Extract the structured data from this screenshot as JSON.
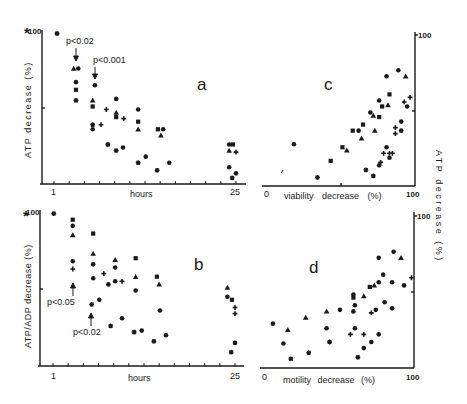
{
  "figure": {
    "asterisk_a": "*",
    "asterisk_b": "*",
    "colors": {
      "ink": "#1a1a1a",
      "background": "#ffffff"
    }
  },
  "chart_data": [
    {
      "id": "a",
      "type": "scatter",
      "panel_label": "a",
      "xlabel": "hours",
      "ylabel": "ATP decrease (%)",
      "x_ticks_labels": [
        "1",
        "25"
      ],
      "y_tick_label": "100",
      "xlim": [
        1,
        25
      ],
      "ylim": [
        0,
        100
      ],
      "annotations": [
        {
          "text": "p<0.02",
          "x": 4.0,
          "y": 88
        },
        {
          "text": "p<0.001",
          "x": 6.2,
          "y": 76
        }
      ],
      "points": [
        {
          "m": "star",
          "x": 1.4,
          "y": 99
        },
        {
          "m": "triangle",
          "x": 3.6,
          "y": 76
        },
        {
          "m": "diamond",
          "x": 4.2,
          "y": 76
        },
        {
          "m": "diamond",
          "x": 3.9,
          "y": 67
        },
        {
          "m": "square",
          "x": 3.9,
          "y": 62
        },
        {
          "m": "star",
          "x": 3.9,
          "y": 55
        },
        {
          "m": "diamond",
          "x": 6.4,
          "y": 65
        },
        {
          "m": "triangle",
          "x": 6.1,
          "y": 55
        },
        {
          "m": "square",
          "x": 6.1,
          "y": 51
        },
        {
          "m": "star",
          "x": 6.1,
          "y": 39
        },
        {
          "m": "diamond",
          "x": 6.1,
          "y": 36
        },
        {
          "m": "plus",
          "x": 7.9,
          "y": 49
        },
        {
          "m": "plus",
          "x": 7.2,
          "y": 39
        },
        {
          "m": "star",
          "x": 8.1,
          "y": 26
        },
        {
          "m": "diamond",
          "x": 9.2,
          "y": 56
        },
        {
          "m": "triangle",
          "x": 9.2,
          "y": 47
        },
        {
          "m": "square",
          "x": 9.2,
          "y": 44
        },
        {
          "m": "star",
          "x": 9.2,
          "y": 22
        },
        {
          "m": "plus",
          "x": 10.2,
          "y": 43
        },
        {
          "m": "diamond",
          "x": 10.1,
          "y": 24
        },
        {
          "m": "diamond",
          "x": 12.1,
          "y": 49
        },
        {
          "m": "square",
          "x": 12.1,
          "y": 41
        },
        {
          "m": "triangle",
          "x": 12.1,
          "y": 36
        },
        {
          "m": "star",
          "x": 12.1,
          "y": 14
        },
        {
          "m": "diamond",
          "x": 13.1,
          "y": 18
        },
        {
          "m": "square",
          "x": 14.7,
          "y": 36
        },
        {
          "m": "diamond",
          "x": 15.4,
          "y": 36
        },
        {
          "m": "triangle",
          "x": 15.1,
          "y": 32
        },
        {
          "m": "star",
          "x": 14.6,
          "y": 9
        },
        {
          "m": "diamond",
          "x": 16.2,
          "y": 14
        },
        {
          "m": "diamond",
          "x": 24.1,
          "y": 26
        },
        {
          "m": "square",
          "x": 24.6,
          "y": 26
        },
        {
          "m": "triangle",
          "x": 24.1,
          "y": 22
        },
        {
          "m": "plus",
          "x": 25.0,
          "y": 21
        },
        {
          "m": "diamond",
          "x": 24.1,
          "y": 11
        },
        {
          "m": "star",
          "x": 24.5,
          "y": 4
        },
        {
          "m": "diamond",
          "x": 25.0,
          "y": 7
        }
      ]
    },
    {
      "id": "b",
      "type": "scatter",
      "panel_label": "b",
      "xlabel": "hours",
      "ylabel": "ATP/ADP decrease (%)",
      "x_ticks_labels": [
        "1",
        "25"
      ],
      "y_tick_label": "100",
      "xlim": [
        1,
        25
      ],
      "ylim": [
        0,
        100
      ],
      "annotations": [
        {
          "text": "p<0.05",
          "x": 3.9,
          "y": 42
        },
        {
          "text": "p<0.02",
          "x": 6.0,
          "y": 24
        }
      ],
      "points": [
        {
          "m": "star",
          "x": 1.1,
          "y": 99
        },
        {
          "m": "square",
          "x": 3.6,
          "y": 95
        },
        {
          "m": "diamond",
          "x": 3.6,
          "y": 91
        },
        {
          "m": "triangle",
          "x": 3.6,
          "y": 85
        },
        {
          "m": "diamond",
          "x": 3.6,
          "y": 68
        },
        {
          "m": "plus",
          "x": 3.6,
          "y": 63
        },
        {
          "m": "square",
          "x": 6.3,
          "y": 86
        },
        {
          "m": "triangle",
          "x": 6.3,
          "y": 73
        },
        {
          "m": "diamond",
          "x": 6.3,
          "y": 66
        },
        {
          "m": "diamond",
          "x": 6.3,
          "y": 57
        },
        {
          "m": "star",
          "x": 6.1,
          "y": 40
        },
        {
          "m": "plus",
          "x": 7.7,
          "y": 60
        },
        {
          "m": "diamond",
          "x": 8.3,
          "y": 53
        },
        {
          "m": "diamond",
          "x": 7.1,
          "y": 43
        },
        {
          "m": "triangle",
          "x": 9.2,
          "y": 69
        },
        {
          "m": "diamond",
          "x": 9.2,
          "y": 64
        },
        {
          "m": "diamond",
          "x": 9.2,
          "y": 55
        },
        {
          "m": "plus",
          "x": 10.1,
          "y": 55
        },
        {
          "m": "star",
          "x": 8.6,
          "y": 26
        },
        {
          "m": "diamond",
          "x": 10.1,
          "y": 31
        },
        {
          "m": "square",
          "x": 11.9,
          "y": 70
        },
        {
          "m": "triangle",
          "x": 11.9,
          "y": 58
        },
        {
          "m": "diamond",
          "x": 11.9,
          "y": 49
        },
        {
          "m": "star",
          "x": 11.7,
          "y": 22
        },
        {
          "m": "diamond",
          "x": 12.7,
          "y": 23
        },
        {
          "m": "square",
          "x": 14.7,
          "y": 58
        },
        {
          "m": "triangle",
          "x": 15.0,
          "y": 53
        },
        {
          "m": "diamond",
          "x": 15.1,
          "y": 36
        },
        {
          "m": "star",
          "x": 14.3,
          "y": 16
        },
        {
          "m": "diamond",
          "x": 15.9,
          "y": 20
        },
        {
          "m": "triangle",
          "x": 24.0,
          "y": 51
        },
        {
          "m": "diamond",
          "x": 24.0,
          "y": 45
        },
        {
          "m": "square",
          "x": 24.6,
          "y": 43
        },
        {
          "m": "plus",
          "x": 25.0,
          "y": 38
        },
        {
          "m": "plus",
          "x": 25.0,
          "y": 34
        },
        {
          "m": "diamond",
          "x": 25.0,
          "y": 15
        },
        {
          "m": "star",
          "x": 24.5,
          "y": 9
        }
      ]
    },
    {
      "id": "c",
      "type": "scatter",
      "panel_label": "c",
      "xlabel": "viability decrease (%)",
      "ylabel": "ATP decrease (%)",
      "x_ticks_labels": [
        "0",
        "100"
      ],
      "y_tick_label": "100",
      "xlim": [
        0,
        100
      ],
      "ylim": [
        0,
        100
      ],
      "points": [
        {
          "m": "tick",
          "x": 11,
          "y": 9
        },
        {
          "m": "diamond",
          "x": 19,
          "y": 27
        },
        {
          "m": "star",
          "x": 35,
          "y": 5
        },
        {
          "m": "square",
          "x": 44,
          "y": 16
        },
        {
          "m": "square",
          "x": 52,
          "y": 25
        },
        {
          "m": "triangle",
          "x": 55,
          "y": 23
        },
        {
          "m": "square",
          "x": 59,
          "y": 36
        },
        {
          "m": "diamond",
          "x": 63,
          "y": 36
        },
        {
          "m": "square",
          "x": 66,
          "y": 40
        },
        {
          "m": "triangle",
          "x": 65,
          "y": 31
        },
        {
          "m": "star",
          "x": 68,
          "y": 10
        },
        {
          "m": "star",
          "x": 73,
          "y": 6
        },
        {
          "m": "diamond",
          "x": 71,
          "y": 48
        },
        {
          "m": "triangle",
          "x": 73,
          "y": 46
        },
        {
          "m": "square",
          "x": 77,
          "y": 45
        },
        {
          "m": "triangle",
          "x": 74,
          "y": 36
        },
        {
          "m": "diamond",
          "x": 77,
          "y": 56
        },
        {
          "m": "square",
          "x": 79,
          "y": 52
        },
        {
          "m": "triangle",
          "x": 83,
          "y": 53
        },
        {
          "m": "diamond",
          "x": 82,
          "y": 72
        },
        {
          "m": "square",
          "x": 84,
          "y": 60
        },
        {
          "m": "diamond",
          "x": 90,
          "y": 76
        },
        {
          "m": "triangle",
          "x": 95,
          "y": 72
        },
        {
          "m": "plus",
          "x": 94,
          "y": 55
        },
        {
          "m": "diamond",
          "x": 96,
          "y": 52
        },
        {
          "m": "plus",
          "x": 98,
          "y": 58
        },
        {
          "m": "diamond",
          "x": 92,
          "y": 42
        },
        {
          "m": "plus",
          "x": 88,
          "y": 38
        },
        {
          "m": "diamond",
          "x": 92,
          "y": 36
        },
        {
          "m": "plus",
          "x": 88,
          "y": 34
        },
        {
          "m": "diamond",
          "x": 82,
          "y": 25
        },
        {
          "m": "plus",
          "x": 80,
          "y": 21
        },
        {
          "m": "plus",
          "x": 84,
          "y": 21
        },
        {
          "m": "plus",
          "x": 86,
          "y": 21
        },
        {
          "m": "diamond",
          "x": 84,
          "y": 18
        },
        {
          "m": "plus",
          "x": 78,
          "y": 15
        },
        {
          "m": "diamond",
          "x": 77,
          "y": 13
        }
      ]
    },
    {
      "id": "d",
      "type": "scatter",
      "panel_label": "d",
      "xlabel": "motility decrease (%)",
      "ylabel": "ATP decrease (%)",
      "x_ticks_labels": [
        "0",
        "100"
      ],
      "y_tick_label": "100",
      "xlim": [
        0,
        100
      ],
      "ylim": [
        0,
        100
      ],
      "points": [
        {
          "m": "diamond",
          "x": 6,
          "y": 29
        },
        {
          "m": "triangle",
          "x": 16,
          "y": 25
        },
        {
          "m": "diamond",
          "x": 13,
          "y": 16
        },
        {
          "m": "star",
          "x": 18,
          "y": 6
        },
        {
          "m": "triangle",
          "x": 28,
          "y": 33
        },
        {
          "m": "star",
          "x": 30,
          "y": 10
        },
        {
          "m": "triangle",
          "x": 42,
          "y": 37
        },
        {
          "m": "diamond",
          "x": 42,
          "y": 26
        },
        {
          "m": "star",
          "x": 44,
          "y": 17
        },
        {
          "m": "diamond",
          "x": 51,
          "y": 38
        },
        {
          "m": "diamond",
          "x": 60,
          "y": 48
        },
        {
          "m": "square",
          "x": 60,
          "y": 46
        },
        {
          "m": "diamond",
          "x": 61,
          "y": 41
        },
        {
          "m": "diamond",
          "x": 60,
          "y": 37
        },
        {
          "m": "triangle",
          "x": 67,
          "y": 47
        },
        {
          "m": "square",
          "x": 71,
          "y": 53
        },
        {
          "m": "diamond",
          "x": 77,
          "y": 56
        },
        {
          "m": "triangle",
          "x": 74,
          "y": 54
        },
        {
          "m": "plus",
          "x": 58,
          "y": 22
        },
        {
          "m": "diamond",
          "x": 61,
          "y": 26
        },
        {
          "m": "plus",
          "x": 67,
          "y": 22
        },
        {
          "m": "star",
          "x": 63,
          "y": 7
        },
        {
          "m": "diamond",
          "x": 67,
          "y": 13
        },
        {
          "m": "diamond",
          "x": 72,
          "y": 17
        },
        {
          "m": "plus",
          "x": 72,
          "y": 36
        },
        {
          "m": "diamond",
          "x": 75,
          "y": 38
        },
        {
          "m": "diamond",
          "x": 77,
          "y": 72
        },
        {
          "m": "diamond",
          "x": 87,
          "y": 76
        },
        {
          "m": "triangle",
          "x": 92,
          "y": 72
        },
        {
          "m": "diamond",
          "x": 80,
          "y": 61
        },
        {
          "m": "diamond",
          "x": 86,
          "y": 56
        },
        {
          "m": "diamond",
          "x": 94,
          "y": 54
        },
        {
          "m": "plus",
          "x": 99,
          "y": 59
        },
        {
          "m": "diamond",
          "x": 81,
          "y": 43
        },
        {
          "m": "diamond",
          "x": 86,
          "y": 39
        },
        {
          "m": "diamond",
          "x": 77,
          "y": 22
        }
      ]
    }
  ]
}
